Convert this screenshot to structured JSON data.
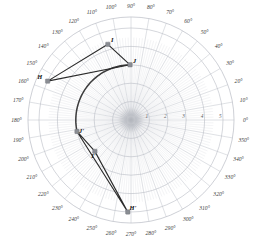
{
  "figure": {
    "background": "#ffffff",
    "grid_color": "#b9bcc4",
    "spoke_color": "#c3c6cd",
    "shape_color": "#2b2b2b",
    "marker_color": "#8a8d93",
    "arc_color": "#3c3c3c"
  },
  "chart_data": {
    "type": "scatter",
    "title": "",
    "subtitle": "",
    "xlabel": "",
    "ylabel": "",
    "coordinate_system": "polar",
    "grid": true,
    "legend_position": "none",
    "center": {
      "x": 131,
      "y": 120
    },
    "pixels_per_unit": 18.4,
    "angle_axis": {
      "unit": "degrees",
      "start": 0,
      "step": 10,
      "direction": "counterclockwise",
      "zero_at": "east",
      "tick_labels": [
        "0°",
        "10°",
        "20°",
        "30°",
        "40°",
        "50°",
        "60°",
        "70°",
        "80°",
        "90°",
        "100°",
        "110°",
        "120°",
        "130°",
        "140°",
        "150°",
        "160°",
        "170°",
        "180°",
        "190°",
        "200°",
        "210°",
        "220°",
        "230°",
        "240°",
        "250°",
        "260°",
        "270°",
        "280°",
        "290°",
        "300°",
        "310°",
        "320°",
        "330°",
        "340°",
        "350°"
      ]
    },
    "radial_axis": {
      "min": 0,
      "max": 5.6,
      "ring_values": [
        1,
        2,
        3,
        4,
        5
      ],
      "tick_labels": [
        "1",
        "2",
        "3",
        "4",
        "5"
      ],
      "label_angle_deg": 0
    },
    "series": [
      {
        "name": "pre-image triangle HIJ",
        "closed": true,
        "points": [
          {
            "label": "H",
            "theta_deg": 155,
            "r": 5.0
          },
          {
            "label": "I",
            "theta_deg": 107,
            "r": 4.3
          },
          {
            "label": "J",
            "theta_deg": 91,
            "r": 3.0
          }
        ]
      },
      {
        "name": "image triangle H'I'J'",
        "closed": true,
        "points": [
          {
            "label": "H'",
            "theta_deg": 268,
            "r": 5.0
          },
          {
            "label": "I'",
            "theta_deg": 221,
            "r": 2.6
          },
          {
            "label": "J'",
            "theta_deg": 192,
            "r": 3.0
          }
        ]
      }
    ],
    "annotations": [
      {
        "type": "rotation-arc",
        "from_label": "J",
        "to_label": "J'",
        "r": 3.0,
        "start_theta_deg": 91,
        "end_theta_deg": 192,
        "sweep_deg": 101
      }
    ]
  }
}
